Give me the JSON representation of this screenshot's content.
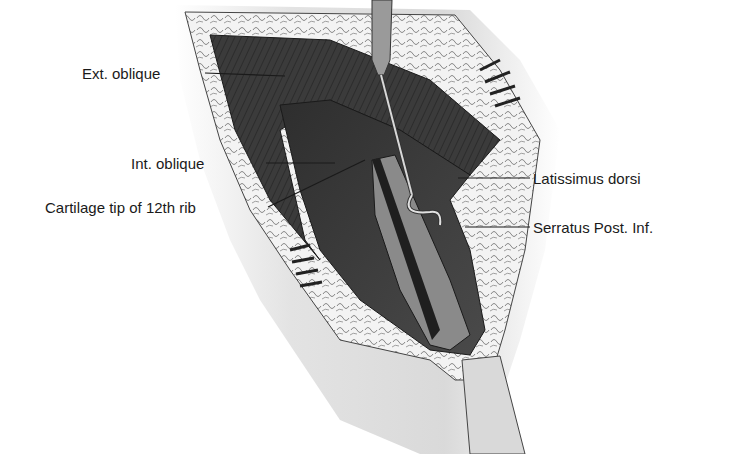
{
  "figure": {
    "labels": [
      {
        "id": "ext-oblique",
        "text": "Ext. oblique"
      },
      {
        "id": "int-oblique",
        "text": "Int. oblique"
      },
      {
        "id": "cartilage-tip",
        "text": "Cartilage tip of 12th rib"
      },
      {
        "id": "latissimus-dorsi",
        "text": "Latissimus dorsi"
      },
      {
        "id": "serratus-post-inf",
        "text": "Serratus Post. Inf."
      }
    ],
    "colors": {
      "background": "#ffffff",
      "skin": "#e6e6e6",
      "fat": "#f2f2f2",
      "muscle_dark": "#3a3a3a",
      "muscle_mid": "#5a5a5a",
      "fascia": "#8c8c8c",
      "leader_line": "#1a1a1a"
    }
  }
}
